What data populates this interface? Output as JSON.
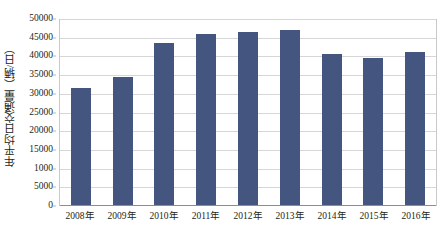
{
  "chart_data": {
    "type": "bar",
    "title": "",
    "subtitle": "",
    "xlabel": "",
    "ylabel": "年平均日交通量（辆/日）",
    "categories": [
      "2008年",
      "2009年",
      "2010年",
      "2011年",
      "2012年",
      "2013年",
      "2014年",
      "2015年",
      "2016年"
    ],
    "values": [
      31400,
      34200,
      43400,
      45600,
      46300,
      46700,
      40500,
      39300,
      40900
    ],
    "series": [
      {
        "name": "年平均日交通量",
        "values": [
          31400,
          34200,
          43400,
          45600,
          46300,
          46700,
          40500,
          39300,
          40900
        ]
      }
    ],
    "ylim": [
      0,
      50000
    ],
    "ytick_values": [
      0,
      5000,
      10000,
      15000,
      20000,
      25000,
      30000,
      35000,
      40000,
      45000,
      50000
    ],
    "ytick_labels": [
      "0",
      "5000",
      "1000",
      "15000",
      "20000",
      "25000",
      "30000",
      "35000",
      "40000",
      "45000",
      "50000"
    ],
    "grid": true,
    "grid_axis": "y",
    "legend": false,
    "legend_position": "none",
    "bar_color": "#44557f",
    "gridline_color": "#d6d6d6",
    "axis_color": "#8d8d8d",
    "plot_border_color": "#c9c9c9",
    "text_color": "#231f20",
    "background_color": "#ffffff",
    "annotations": []
  }
}
